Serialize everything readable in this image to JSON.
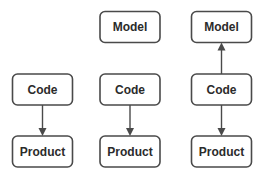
{
  "diagram": {
    "columns": [
      {
        "id": "col1",
        "nodes": [
          {
            "id": "c1-code",
            "label": "Code",
            "row": "middle"
          },
          {
            "id": "c1-product",
            "label": "Product",
            "row": "bottom"
          }
        ],
        "edges": [
          {
            "from": "c1-code",
            "to": "c1-product",
            "direction": "down"
          }
        ]
      },
      {
        "id": "col2",
        "nodes": [
          {
            "id": "c2-model",
            "label": "Model",
            "row": "top"
          },
          {
            "id": "c2-code",
            "label": "Code",
            "row": "middle"
          },
          {
            "id": "c2-product",
            "label": "Product",
            "row": "bottom"
          }
        ],
        "edges": [
          {
            "from": "c2-code",
            "to": "c2-product",
            "direction": "down"
          }
        ]
      },
      {
        "id": "col3",
        "nodes": [
          {
            "id": "c3-model",
            "label": "Model",
            "row": "top"
          },
          {
            "id": "c3-code",
            "label": "Code",
            "row": "middle"
          },
          {
            "id": "c3-product",
            "label": "Product",
            "row": "bottom"
          }
        ],
        "edges": [
          {
            "from": "c3-code",
            "to": "c3-model",
            "direction": "up"
          },
          {
            "from": "c3-code",
            "to": "c3-product",
            "direction": "down"
          }
        ]
      }
    ]
  }
}
